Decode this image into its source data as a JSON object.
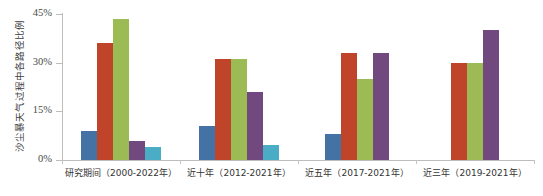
{
  "chart_data": {
    "type": "bar",
    "title": "",
    "xlabel": "",
    "ylabel": "沙尘暴天气过程中各路径比例",
    "ylim": [
      0,
      45
    ],
    "ytick_labels": [
      "0%",
      "15%",
      "30%",
      "45%"
    ],
    "ytick_values": [
      0,
      15,
      30,
      45
    ],
    "grid": false,
    "legend": "none",
    "categories": [
      "研究期间（2000-2022年）",
      "近十年（2012-2021年）",
      "近五年（2017-2021年）",
      "近三年（2019-2021年）"
    ],
    "series": [
      {
        "name": "series-1",
        "color": "#4472a4",
        "values": [
          9,
          10.5,
          8,
          null
        ]
      },
      {
        "name": "series-2",
        "color": "#c0442a",
        "values": [
          36,
          31,
          33,
          30
        ]
      },
      {
        "name": "series-3",
        "color": "#9dbb55",
        "values": [
          43.5,
          31,
          25,
          30
        ]
      },
      {
        "name": "series-4",
        "color": "#71497f",
        "values": [
          6,
          21,
          33,
          40
        ]
      },
      {
        "name": "series-5",
        "color": "#4bacc6",
        "values": [
          4,
          4.5,
          null,
          null
        ]
      }
    ]
  },
  "axis": {
    "y_title": "沙尘暴天气过程中各路径比例"
  }
}
